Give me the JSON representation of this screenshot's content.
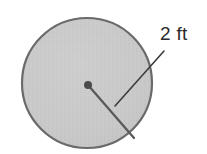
{
  "figure": {
    "type": "geometry-diagram",
    "background_color": "#ffffff",
    "width": 207,
    "height": 154,
    "circle": {
      "center_x": 87,
      "center_y": 83,
      "radius": 66,
      "fill_color": "#c9c9c9",
      "stroke_color": "#6a6a6a",
      "stroke_width": 2.2,
      "texture": "stipple"
    },
    "center_dot": {
      "name": "center-point",
      "x": 88,
      "y": 85,
      "radius": 4,
      "color": "#4a4a4a"
    },
    "radius_line": {
      "name": "radius-segment",
      "x1": 88,
      "y1": 85,
      "x2": 134,
      "y2": 138,
      "color": "#5a5a5a",
      "stroke_width": 2.3
    },
    "leader_line": {
      "name": "leader-line",
      "x1": 164,
      "y1": 51,
      "x2": 115,
      "y2": 106,
      "color": "#3c3c3c",
      "stroke_width": 1.6
    },
    "label": {
      "text": "2 ft",
      "value": "2",
      "unit": "ft",
      "x": 160,
      "y": 24,
      "color": "#2b2b2b",
      "font_size": 19
    }
  }
}
